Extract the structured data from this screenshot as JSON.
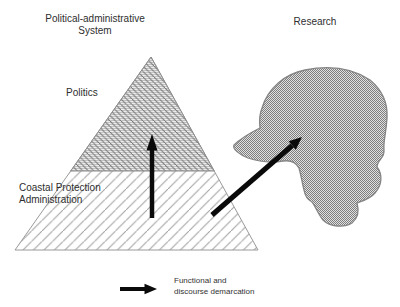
{
  "figure": {
    "left_system": {
      "title_line1": "Political-administrative",
      "title_line2": "System",
      "top_region_label": "Politics",
      "bottom_region_label_line1": "Coastal Protection",
      "bottom_region_label_line2": "Administration"
    },
    "right_system": {
      "title": "Research"
    },
    "legend": {
      "label_line1": "Functional and",
      "label_line2": "discourse demarcation"
    },
    "colors": {
      "background": "#ffffff",
      "arrow": "#0a0a0a",
      "triangle_outline": "#9a9a9a",
      "bottom_hatch_line": "#9f9f9f",
      "top_region_base": "#ededed",
      "top_region_stripe": "#c2c2c2",
      "top_region_hatch": "#707070",
      "blob_dither_dark": "#7e7e7e",
      "blob_dither_light": "#e0e0e0",
      "blob_outline": "#858585",
      "text": "#2e2e2e"
    }
  }
}
